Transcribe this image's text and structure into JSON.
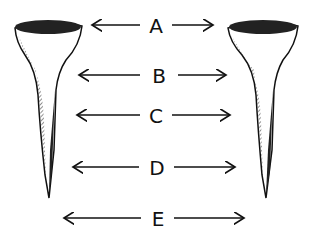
{
  "diagram": {
    "labels": [
      {
        "id": "A",
        "text": "A",
        "y": 25,
        "left": 90,
        "right": 215
      },
      {
        "id": "B",
        "text": "B",
        "y": 75,
        "left": 77,
        "right": 228
      },
      {
        "id": "C",
        "text": "C",
        "y": 115,
        "left": 75,
        "right": 232
      },
      {
        "id": "D",
        "text": "D",
        "y": 167,
        "left": 71,
        "right": 237
      },
      {
        "id": "E",
        "text": "E",
        "y": 218,
        "left": 62,
        "right": 246
      }
    ]
  }
}
